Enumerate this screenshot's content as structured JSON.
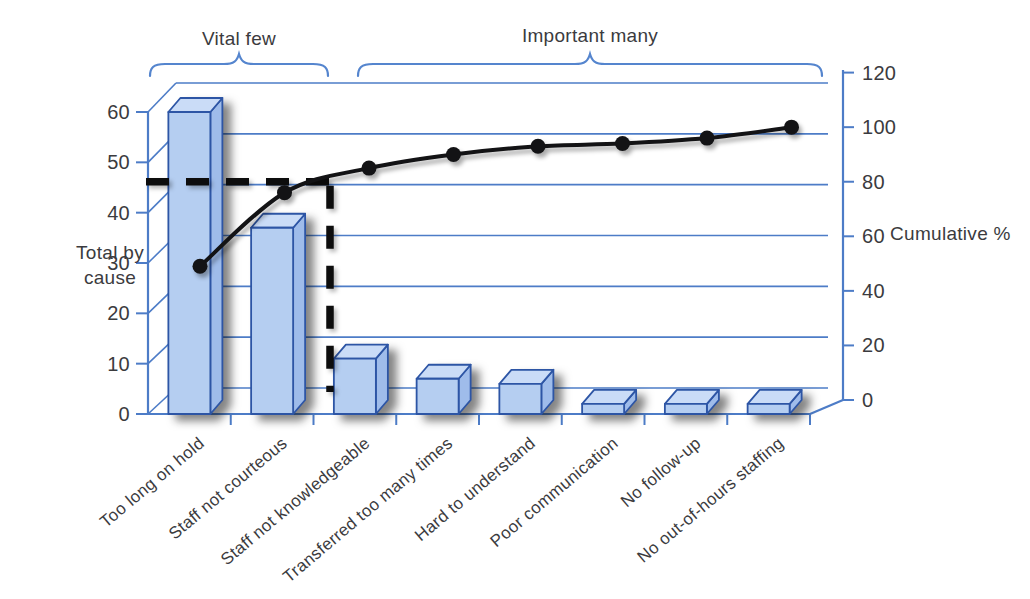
{
  "figure": {
    "kind": "pareto-chart-scan",
    "background": "#ffffff"
  },
  "chart_data": {
    "type": "bar",
    "subtype": "pareto (3D bars + cumulative line)",
    "title": "",
    "categories": [
      "Too long on hold",
      "Staff not courteous",
      "Staff not knowledgeable",
      "Transferred too many times",
      "Hard to understand",
      "Poor communication",
      "No follow-up",
      "No out-of-hours staffing"
    ],
    "series": [
      {
        "name": "Total by cause",
        "type": "bar",
        "axis": "left",
        "values": [
          60,
          37,
          11,
          7,
          6,
          2,
          2,
          2
        ]
      },
      {
        "name": "Cumulative %",
        "type": "line",
        "axis": "right",
        "values": [
          49,
          76,
          85,
          90,
          93,
          94,
          96,
          100
        ]
      }
    ],
    "left_axis": {
      "label": "Total by cause",
      "label_lines": [
        "Total by",
        "cause"
      ],
      "ticks": [
        0,
        10,
        20,
        30,
        40,
        50,
        60
      ],
      "range": [
        0,
        60
      ]
    },
    "right_axis": {
      "label": "Cumulative %",
      "ticks": [
        0,
        20,
        40,
        60,
        80,
        100,
        120
      ],
      "range": [
        0,
        120
      ]
    },
    "annotations": {
      "vital_few_label": "Vital few",
      "important_many_label": "Important many",
      "vital_few_categories": [
        "Too long on hold",
        "Staff not courteous"
      ],
      "cutoff_pct": 80,
      "cutoff_style": "black dashed horizontal at 80% ending in dashed vertical drop after second bar"
    },
    "grid": "horizontal gridlines on raised 3D back wall",
    "legend": "none",
    "colors": {
      "bar_front": "#b5cef1",
      "bar_top": "#cadcf7",
      "bar_side": "#9fbcea",
      "bar_outline": "#2d55a5",
      "axis_blue": "#4d7cc7",
      "brace_blue": "#5585ce",
      "line_black": "#131315",
      "dash_black": "#0d0d0d",
      "text": "#3b3b3e"
    }
  }
}
